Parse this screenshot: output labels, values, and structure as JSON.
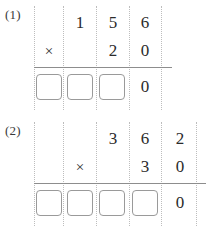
{
  "worksheet": {
    "background_color": "#ffffff",
    "text_color": "#2b2b2b",
    "guide_color": "#bdbdbd",
    "rule_color": "#8d8d8d",
    "box_border_color": "#9a9a9a"
  },
  "problems": [
    {
      "label": "(1)",
      "multiplicand": "156",
      "multiplier": "20",
      "operator": "×",
      "top_row": [
        "",
        "1",
        "5",
        "6"
      ],
      "bottom_row": [
        "×",
        "",
        "2",
        "0"
      ],
      "answer_row": [
        "box",
        "box",
        "box",
        "0"
      ],
      "answer_boxes": 3,
      "prefilled_answer_digit": "0",
      "columns": 4
    },
    {
      "label": "(2)",
      "multiplicand": "362",
      "multiplier": "30",
      "operator": "×",
      "top_row": [
        "",
        "",
        "3",
        "6",
        "2"
      ],
      "bottom_row": [
        "",
        "×",
        "",
        "3",
        "0"
      ],
      "answer_row": [
        "box",
        "box",
        "box",
        "box",
        "0"
      ],
      "answer_boxes": 4,
      "prefilled_answer_digit": "0",
      "columns": 5
    }
  ]
}
